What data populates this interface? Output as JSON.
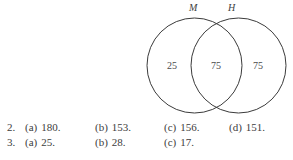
{
  "venn": {
    "left_set_label": "M",
    "right_set_label": "H",
    "regions": {
      "left_only": "25",
      "intersection": "75",
      "right_only": "75"
    },
    "stroke_color": "#3b3b3b"
  },
  "answer_key": {
    "rows": [
      {
        "number": "2.",
        "items": [
          {
            "letter": "(a)",
            "value": "180."
          },
          {
            "letter": "(b)",
            "value": "153."
          },
          {
            "letter": "(c)",
            "value": "156."
          },
          {
            "letter": "(d)",
            "value": "151."
          }
        ]
      },
      {
        "number": "3.",
        "items": [
          {
            "letter": "(a)",
            "value": "25."
          },
          {
            "letter": "(b)",
            "value": "28."
          },
          {
            "letter": "(c)",
            "value": "17."
          }
        ]
      }
    ]
  }
}
